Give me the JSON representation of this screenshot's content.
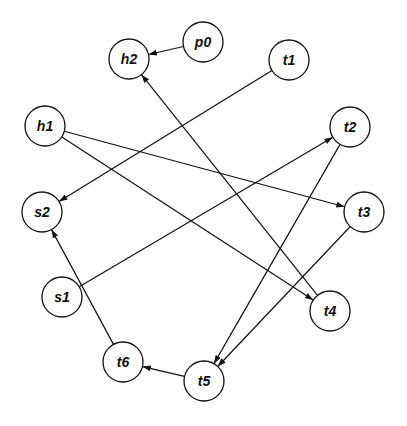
{
  "diagram": {
    "type": "directed-graph",
    "node_radius": 20,
    "stroke_color": "#111111",
    "nodes": [
      {
        "id": "p0",
        "label": "p0",
        "x": 203,
        "y": 42
      },
      {
        "id": "h2",
        "label": "h2",
        "x": 129,
        "y": 59
      },
      {
        "id": "t1",
        "label": "t1",
        "x": 289,
        "y": 60
      },
      {
        "id": "h1",
        "label": "h1",
        "x": 45,
        "y": 126
      },
      {
        "id": "t2",
        "label": "t2",
        "x": 350,
        "y": 127
      },
      {
        "id": "s2",
        "label": "s2",
        "x": 42,
        "y": 212
      },
      {
        "id": "t3",
        "label": "t3",
        "x": 364,
        "y": 212
      },
      {
        "id": "s1",
        "label": "s1",
        "x": 62,
        "y": 297
      },
      {
        "id": "t4",
        "label": "t4",
        "x": 330,
        "y": 311
      },
      {
        "id": "t6",
        "label": "t6",
        "x": 123,
        "y": 362
      },
      {
        "id": "t5",
        "label": "t5",
        "x": 204,
        "y": 381
      }
    ],
    "edges": [
      {
        "from": "p0",
        "to": "h2"
      },
      {
        "from": "t1",
        "to": "s2"
      },
      {
        "from": "h1",
        "to": "t3"
      },
      {
        "from": "h1",
        "to": "t4"
      },
      {
        "from": "t4",
        "to": "h2"
      },
      {
        "from": "s1",
        "to": "t2"
      },
      {
        "from": "t2",
        "to": "t5"
      },
      {
        "from": "t3",
        "to": "t5"
      },
      {
        "from": "t5",
        "to": "t6"
      },
      {
        "from": "t6",
        "to": "s2"
      }
    ]
  }
}
